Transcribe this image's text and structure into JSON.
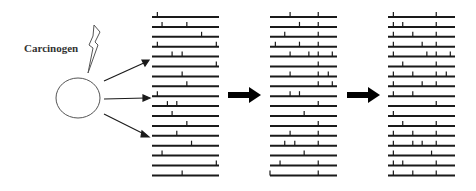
{
  "diagram": {
    "label": "Carcinogen",
    "colors": {
      "line": "#1a1a1a",
      "stroke": "#555555",
      "background": "#ffffff"
    },
    "columns": [
      {
        "name": "initial-population",
        "rows": [
          [
            0.08
          ],
          [
            0.15,
            0.52
          ],
          [
            0.74
          ],
          [
            0.08,
            0.96
          ],
          [
            0.3,
            0.45
          ],
          [
            0.96
          ],
          [
            0.45
          ],
          [
            0.52
          ],
          [
            0.08
          ],
          [
            0.23,
            0.37
          ],
          [
            0.3
          ],
          [
            0.52
          ],
          [
            0.37
          ],
          [
            0.59
          ],
          [
            0.15
          ],
          [
            0.96
          ],
          [
            0.45
          ]
        ]
      },
      {
        "name": "intermediate-population",
        "rows": [
          [
            0.3,
            0.72
          ],
          [
            0.44,
            0.72
          ],
          [
            0.22,
            0.72
          ],
          [
            0.08,
            0.44,
            0.72
          ],
          [
            0.3,
            0.58,
            0.72,
            0.93
          ],
          [
            0.72
          ],
          [
            0.3,
            0.72,
            0.87
          ],
          [
            0.72,
            0.93
          ],
          [
            0.3,
            0.44
          ],
          [
            0.72
          ],
          [
            0.51
          ],
          [
            0.72
          ],
          [
            0.3,
            0.72
          ],
          [
            0.22,
            0.37,
            0.72
          ],
          [
            0.51
          ],
          [
            0.15,
            0.72
          ],
          [
            0.0,
            0.72
          ]
        ]
      },
      {
        "name": "final-population",
        "rows": [
          [
            0.08,
            0.72
          ],
          [
            0.08,
            0.22,
            0.72
          ],
          [
            0.08,
            0.37,
            0.72
          ],
          [
            0.08,
            0.51,
            0.72
          ],
          [
            0.08,
            0.58,
            0.72,
            0.93
          ],
          [
            0.22,
            0.72
          ],
          [
            0.08,
            0.37,
            0.72,
            0.87
          ],
          [
            0.08,
            0.51,
            0.72
          ],
          [
            0.08,
            0.37
          ],
          [
            0.72
          ],
          [
            0.08
          ],
          [
            0.22,
            0.72
          ],
          [
            0.08,
            0.37,
            0.72
          ],
          [
            0.08,
            0.37,
            0.51,
            0.72
          ],
          [
            0.08,
            0.65
          ],
          [
            0.08,
            0.22,
            0.72
          ],
          [
            0.08,
            0.37,
            0.72
          ]
        ]
      }
    ],
    "transition_arrows": [
      "arrow-1-to-2",
      "arrow-2-to-3"
    ]
  }
}
